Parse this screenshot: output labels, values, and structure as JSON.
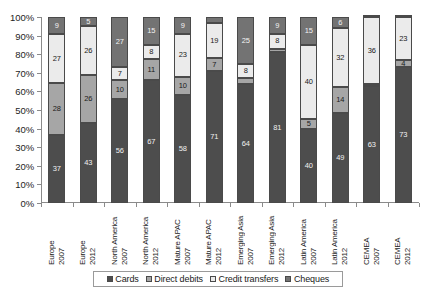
{
  "chart_data": {
    "type": "bar",
    "title": "",
    "subtitle": "",
    "xlabel": "",
    "ylabel": "",
    "stacked": true,
    "normalized": true,
    "grid": false,
    "legend_position": "bottom",
    "ylim": [
      0,
      100
    ],
    "ytick_labels": [
      "100%",
      "90%",
      "80%",
      "70%",
      "60%",
      "50%",
      "40%",
      "30%",
      "20%",
      "10%",
      "0%"
    ],
    "ytick_values": [
      100,
      90,
      80,
      70,
      60,
      50,
      40,
      30,
      20,
      10,
      0
    ],
    "categories": [
      "Europe 2007",
      "Europe 2012",
      "North America 2007",
      "North America 2012",
      "Mature APAC 2007",
      "Mature APAC 2012",
      "Emerging Asia 2007",
      "Emerging Asia 2012",
      "Latin America 2007",
      "Latin America 2012",
      "CEMEA 2007",
      "CEMEA 2012"
    ],
    "category_parts": [
      {
        "region": "Europe",
        "year": "2007"
      },
      {
        "region": "Europe",
        "year": "2012"
      },
      {
        "region": "North America",
        "year": "2007"
      },
      {
        "region": "North America",
        "year": "2012"
      },
      {
        "region": "Mature APAC",
        "year": "2007"
      },
      {
        "region": "Mature APAC",
        "year": "2012"
      },
      {
        "region": "Emerging Asia",
        "year": "2007"
      },
      {
        "region": "Emerging Asia",
        "year": "2012"
      },
      {
        "region": "Latin America",
        "year": "2007"
      },
      {
        "region": "Latin America",
        "year": "2012"
      },
      {
        "region": "CEMEA",
        "year": "2007"
      },
      {
        "region": "CEMEA",
        "year": "2012"
      }
    ],
    "series": [
      {
        "name": "Cards",
        "color": "#4d4d4d",
        "values": [
          37,
          43,
          56,
          67,
          58,
          71,
          64,
          81,
          40,
          49,
          63,
          73
        ]
      },
      {
        "name": "Direct debits",
        "color": "#a6a6a6",
        "values": [
          28,
          26,
          10,
          11,
          10,
          7,
          3,
          2,
          5,
          14,
          1,
          4
        ]
      },
      {
        "name": "Credit transfers",
        "color": "#ebebeb",
        "values": [
          27,
          26,
          7,
          8,
          23,
          19,
          8,
          8,
          40,
          32,
          36,
          23
        ]
      },
      {
        "name": "Cheques",
        "color": "#737373",
        "values": [
          9,
          5,
          27,
          15,
          9,
          3,
          25,
          9,
          15,
          6,
          0,
          0
        ]
      }
    ]
  },
  "legend": {
    "items": [
      {
        "label": "Cards",
        "swatch": "legend-swatch-cards"
      },
      {
        "label": "Direct debits",
        "swatch": "legend-swatch-direct-debits"
      },
      {
        "label": "Credit transfers",
        "swatch": "legend-swatch-credit-transfers"
      },
      {
        "label": "Cheques",
        "swatch": "legend-swatch-cheques"
      }
    ]
  }
}
